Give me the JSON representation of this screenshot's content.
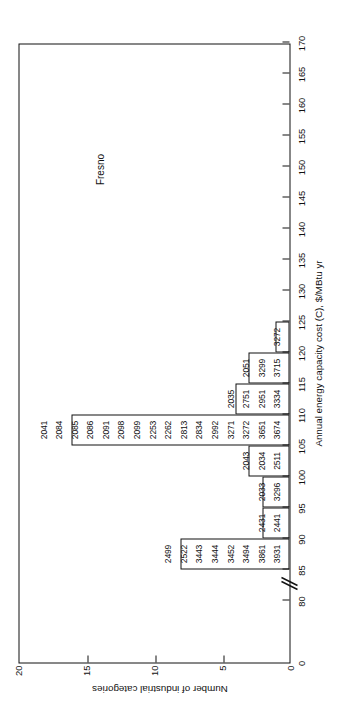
{
  "figure": {
    "annotation": "Fresno",
    "orientation": "rotated-90-ccw"
  },
  "axes": {
    "x": {
      "title": "Annual energy capacity cost (C), $/MBtu yr",
      "ticks": [
        0,
        80,
        85,
        90,
        95,
        100,
        105,
        110,
        115,
        120,
        125,
        130,
        135,
        140,
        145,
        150,
        155,
        160,
        165,
        170
      ],
      "tick_labels": [
        "0",
        "80",
        "85",
        "90",
        "95",
        "100",
        "105",
        "110",
        "115",
        "120",
        "125",
        "130",
        "135",
        "140",
        "145",
        "150",
        "155",
        "160",
        "165",
        "170"
      ],
      "has_axis_break": true
    },
    "y": {
      "title": "Number of industrial categories",
      "ticks": [
        0,
        5,
        10,
        15,
        20
      ],
      "tick_labels": [
        "0",
        "5",
        "10",
        "15",
        "20"
      ],
      "min": 0,
      "max": 20
    }
  },
  "chart_data": {
    "type": "bar",
    "title": "",
    "subtitle": "",
    "xlabel": "Annual energy capacity cost (C), $/MBtu yr",
    "ylabel": "Number of industrial categories",
    "xlim": [
      80,
      170
    ],
    "ylim": [
      0,
      20
    ],
    "grid": false,
    "legend": null,
    "annotations": [
      {
        "text": "Fresno",
        "x": 147,
        "y": 14.5
      }
    ],
    "categories": [
      "80-85",
      "85-90",
      "90-95",
      "95-100",
      "100-105",
      "105-110",
      "110-115",
      "115-120",
      "120-125",
      "125-130"
    ],
    "bin_edges": [
      80,
      85,
      90,
      95,
      100,
      105,
      110,
      115,
      120,
      125,
      130
    ],
    "values": [
      0,
      8,
      2,
      2,
      3,
      16,
      4,
      3,
      1,
      0
    ],
    "bars": [
      {
        "bin": "85-90",
        "start": 85,
        "end": 90,
        "count": 8,
        "labels": [
          "3931",
          "3861",
          "3494",
          "3452",
          "3444",
          "3443",
          "2522",
          "2499"
        ]
      },
      {
        "bin": "90-95",
        "start": 90,
        "end": 95,
        "count": 2,
        "labels": [
          "2441",
          "2431"
        ]
      },
      {
        "bin": "95-100",
        "start": 95,
        "end": 100,
        "count": 2,
        "labels": [
          "3296",
          "2033"
        ]
      },
      {
        "bin": "100-105",
        "start": 100,
        "end": 105,
        "count": 3,
        "labels": [
          "2511",
          "2034",
          "2043"
        ]
      },
      {
        "bin": "105-110",
        "start": 105,
        "end": 110,
        "count": 16,
        "labels": [
          "3674",
          "3651",
          "3272",
          "3271",
          "2992",
          "2834",
          "2813",
          "2262",
          "2253",
          "2099",
          "2098",
          "2091",
          "2086",
          "2085",
          "2084",
          "2041"
        ]
      },
      {
        "bin": "110-115",
        "start": 110,
        "end": 115,
        "count": 4,
        "labels": [
          "3334",
          "2951",
          "2751",
          "2035"
        ]
      },
      {
        "bin": "115-120",
        "start": 115,
        "end": 120,
        "count": 3,
        "labels": [
          "3715",
          "3299",
          "2051"
        ]
      },
      {
        "bin": "120-125",
        "start": 120,
        "end": 125,
        "count": 1,
        "labels": [
          "3272"
        ]
      }
    ]
  }
}
